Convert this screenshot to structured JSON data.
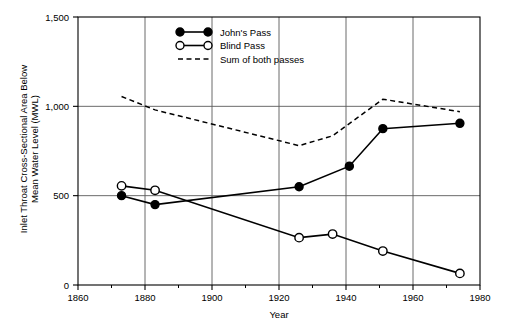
{
  "chart_data": {
    "type": "line",
    "title": "",
    "xlabel": "Year",
    "ylabel": "Inlet Throat Cross-Sectional Area Below Mean Water Level (MWL)",
    "xlim": [
      1860,
      1980
    ],
    "ylim": [
      0,
      1500
    ],
    "xticks": [
      1860,
      1880,
      1900,
      1920,
      1940,
      1960,
      1980
    ],
    "xtick_labels": [
      "1860",
      "1880",
      "1900",
      "1920",
      "1940",
      "1960",
      "1980"
    ],
    "xminor_ticks": [
      1870,
      1890,
      1910,
      1930,
      1950,
      1970
    ],
    "yticks": [
      0,
      500,
      1000,
      1500
    ],
    "ytick_labels": [
      "0",
      "500",
      "1,000",
      "1,500"
    ],
    "grid": "both",
    "legend_position": "top-center",
    "series": [
      {
        "name": "John's Pass",
        "marker": "filled-circle",
        "line": "solid",
        "x": [
          1873,
          1883,
          1926,
          1941,
          1951,
          1974
        ],
        "values": [
          500,
          450,
          550,
          665,
          875,
          905
        ]
      },
      {
        "name": "Blind Pass",
        "marker": "open-circle",
        "line": "solid",
        "x": [
          1873,
          1883,
          1926,
          1936,
          1951,
          1974
        ],
        "values": [
          555,
          530,
          265,
          285,
          190,
          65
        ]
      },
      {
        "name": "Sum of both passes",
        "marker": "none",
        "line": "dashed",
        "x": [
          1873,
          1883,
          1926,
          1936,
          1951,
          1974
        ],
        "values": [
          1055,
          980,
          780,
          835,
          1040,
          970
        ]
      }
    ]
  },
  "legend": {
    "items": [
      {
        "label": "John's Pass",
        "style": "filled-circle"
      },
      {
        "label": "Blind Pass",
        "style": "open-circle"
      },
      {
        "label": "Sum of both passes",
        "style": "dashed"
      }
    ]
  },
  "axes": {
    "x_title": "Year",
    "y_title_line1": "Inlet Throat Cross-Sectional Area Below",
    "y_title_line2": "Mean Water Level (MWL)"
  },
  "colors": {
    "line": "#000000",
    "grid": "#5a5a5a",
    "frame": "#000000",
    "background": "#ffffff"
  }
}
